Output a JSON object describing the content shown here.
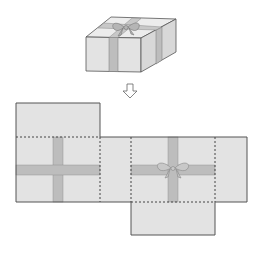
{
  "figure": {
    "arrow_icon": "down-arrow-icon"
  },
  "colors": {
    "face": "#e3e3e3",
    "face_side": "#d6d6d6",
    "face_top": "#ececec",
    "ribbon": "#bdbdbd",
    "edge": "#555555",
    "fold": "#555555"
  }
}
